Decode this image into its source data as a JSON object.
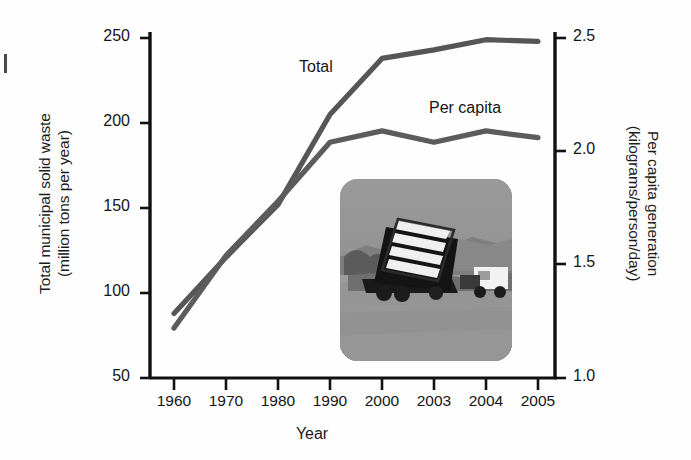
{
  "figure": {
    "background_color": "#fefefe",
    "line_color": "#565656",
    "axis_color": "#111111",
    "text_color": "#151515"
  },
  "axes": {
    "x": {
      "title": "Year",
      "tick_labels": [
        "1960",
        "1970",
        "1980",
        "1990",
        "2000",
        "2003",
        "2004",
        "2005"
      ]
    },
    "y_left": {
      "title_line1": "Total municipal solid waste",
      "title_line2": "(million tons per year)",
      "tick_labels": [
        "250",
        "200",
        "150",
        "100",
        "50"
      ]
    },
    "y_right": {
      "title_line1": "Per capita generation",
      "title_line2": "(kilograms/person/day)",
      "tick_labels": [
        "2.5",
        "2.0",
        "1.5",
        "1.0"
      ]
    }
  },
  "series_labels": {
    "total": "Total",
    "per_capita": "Per capita"
  },
  "inset": {
    "alt": "Dump truck tipping municipal solid waste at a landfill site"
  },
  "chart_data": {
    "type": "line",
    "title": "",
    "xlabel": "Year",
    "categories": [
      "1960",
      "1970",
      "1980",
      "1990",
      "2000",
      "2003",
      "2004",
      "2005"
    ],
    "x": [
      1960,
      1970,
      1980,
      1990,
      2000,
      2003,
      2004,
      2005
    ],
    "grid": false,
    "legend_position": "inline-labels",
    "axes": {
      "left": {
        "label": "Total municipal solid waste (million tons per year)",
        "ticks": [
          50,
          100,
          150,
          200,
          250
        ],
        "ylim": [
          50,
          250
        ]
      },
      "right": {
        "label": "Per capita generation (kilograms/person/day)",
        "ticks": [
          1.0,
          1.5,
          2.0,
          2.5
        ],
        "ylim": [
          1.0,
          2.5
        ]
      }
    },
    "series": [
      {
        "name": "Total",
        "axis": "left",
        "unit": "million tons per year",
        "values": [
          88,
          121,
          152,
          205,
          238,
          243,
          249,
          248
        ]
      },
      {
        "name": "Per capita",
        "axis": "right",
        "unit": "kilograms/person/day",
        "values": [
          1.22,
          1.54,
          1.78,
          2.04,
          2.09,
          2.04,
          2.09,
          2.06
        ]
      }
    ]
  }
}
